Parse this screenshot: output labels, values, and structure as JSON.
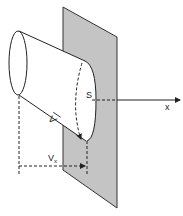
{
  "diagram": {
    "labels": {
      "surface": "S",
      "axis": "x",
      "velocity_vector": "V",
      "velocity_component": "V",
      "velocity_component_subscript": "x"
    },
    "colors": {
      "plane_fill": "#c4c4c4",
      "stroke": "#222222",
      "background": "#ffffff"
    }
  }
}
